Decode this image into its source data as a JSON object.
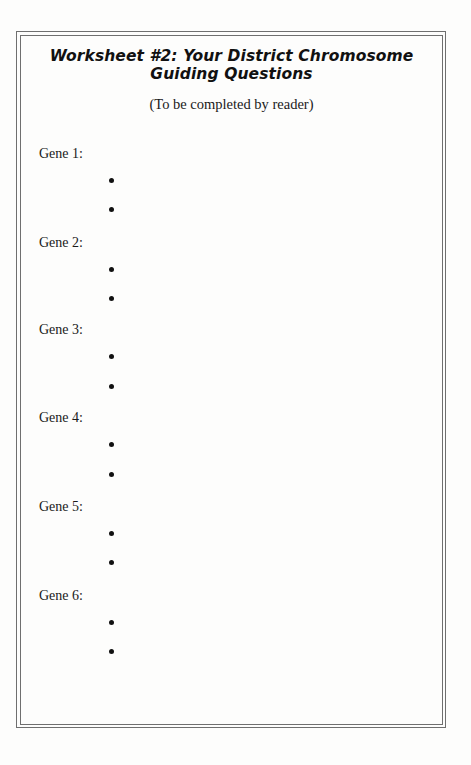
{
  "worksheet": {
    "title_line1": "Worksheet #2: Your District Chromosome",
    "title_line2": "Guiding Questions",
    "subtitle": "(To be completed by reader)",
    "genes": [
      {
        "label": "Gene 1:",
        "bullets": [
          "",
          ""
        ]
      },
      {
        "label": "Gene 2:",
        "bullets": [
          "",
          ""
        ]
      },
      {
        "label": "Gene 3:",
        "bullets": [
          "",
          ""
        ]
      },
      {
        "label": "Gene 4:",
        "bullets": [
          "",
          ""
        ]
      },
      {
        "label": "Gene 5:",
        "bullets": [
          "",
          ""
        ]
      },
      {
        "label": "Gene 6:",
        "bullets": [
          "",
          ""
        ]
      }
    ]
  },
  "colors": {
    "border": "#6f6f6f",
    "text": "#111111",
    "background": "#fdfdfc"
  }
}
